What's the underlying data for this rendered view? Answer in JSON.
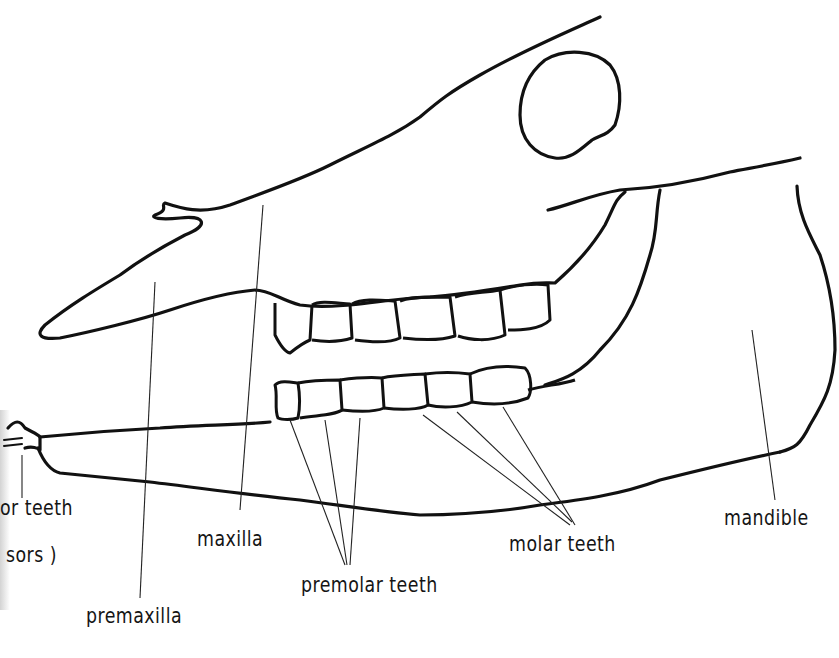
{
  "figure": {
    "background_color": "#ffffff",
    "line_color": "#111111"
  },
  "labels": {
    "incisor_line1": "or  teeth",
    "incisor_line2": "sors )",
    "premaxilla": "premaxilla",
    "maxilla": "maxilla",
    "premolar_teeth": "premolar  teeth",
    "molar_teeth": "molar  teeth",
    "mandible": "mandible"
  }
}
